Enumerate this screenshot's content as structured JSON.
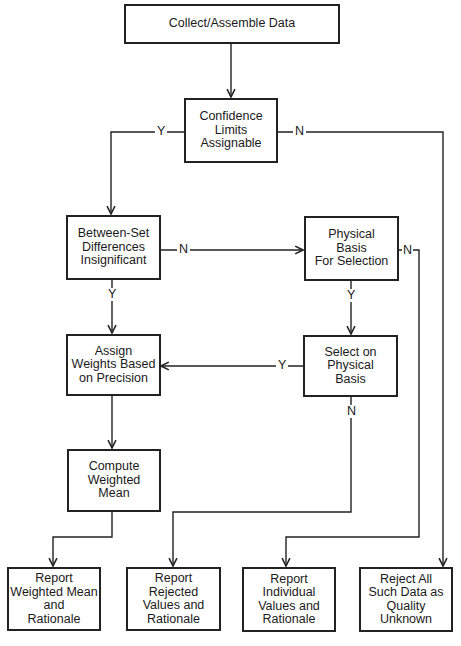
{
  "diagram": {
    "type": "flowchart",
    "nodes": [
      {
        "id": "collect",
        "lines": [
          "Collect/Assemble Data"
        ]
      },
      {
        "id": "confidence",
        "lines": [
          "Confidence",
          "Limits",
          "Assignable"
        ]
      },
      {
        "id": "between",
        "lines": [
          "Between-Set",
          "Differences",
          "Insignificant"
        ]
      },
      {
        "id": "physical",
        "lines": [
          "Physical",
          "Basis",
          "For Selection"
        ]
      },
      {
        "id": "assign",
        "lines": [
          "Assign",
          "Weights Based",
          "on Precision"
        ]
      },
      {
        "id": "select",
        "lines": [
          "Select on",
          "Physical",
          "Basis"
        ]
      },
      {
        "id": "compute",
        "lines": [
          "Compute",
          "Weighted",
          "Mean"
        ]
      },
      {
        "id": "report_mean",
        "lines": [
          "Report",
          "Weighted Mean",
          "and",
          "Rationale"
        ]
      },
      {
        "id": "report_rejected",
        "lines": [
          "Report",
          "Rejected",
          "Values and",
          "Rationale"
        ]
      },
      {
        "id": "report_individual",
        "lines": [
          "Report",
          "Individual",
          "Values and",
          "Rationale"
        ]
      },
      {
        "id": "reject_all",
        "lines": [
          "Reject All",
          "Such Data as",
          "Quality",
          "Unknown"
        ]
      }
    ],
    "edges": [
      {
        "from": "collect",
        "to": "confidence",
        "label": ""
      },
      {
        "from": "confidence",
        "to": "between",
        "label": "Y"
      },
      {
        "from": "confidence",
        "to": "reject_all",
        "label": "N"
      },
      {
        "from": "between",
        "to": "physical",
        "label": "N"
      },
      {
        "from": "between",
        "to": "assign",
        "label": "Y"
      },
      {
        "from": "physical",
        "to": "select",
        "label": "Y"
      },
      {
        "from": "physical",
        "to": "report_individual",
        "label": "N"
      },
      {
        "from": "select",
        "to": "assign",
        "label": "Y"
      },
      {
        "from": "select",
        "to": "report_rejected",
        "label": "N"
      },
      {
        "from": "assign",
        "to": "compute",
        "label": ""
      },
      {
        "from": "compute",
        "to": "report_mean",
        "label": ""
      }
    ],
    "labels": {
      "yes": "Y",
      "no": "N"
    },
    "colors": {
      "line": "#222222",
      "background": "#ffffff",
      "text": "#1a1a1a"
    }
  }
}
